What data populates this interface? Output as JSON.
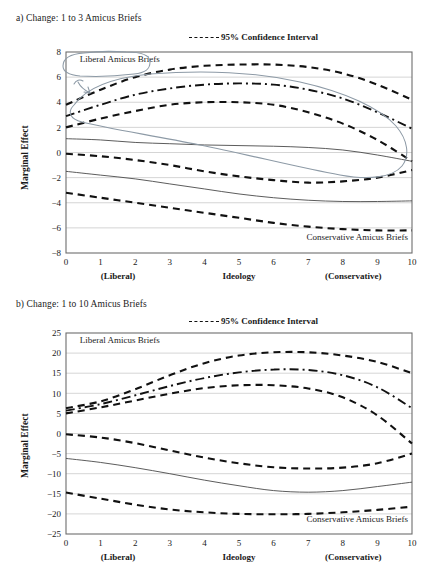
{
  "figure": {
    "panels": [
      {
        "id": "a",
        "title": "a) Change: 1 to 3 Amicus Briefs",
        "legend_label": "95% Confidence Interval",
        "ylabel": "Marginal Effect",
        "xlabel": "Ideology",
        "xcap_left": "(Liberal)",
        "xcap_right": "(Conservative)",
        "annotation_upper": "Liberal Amicus Briefs",
        "annotation_lower": "Conservative Amicus Briefs",
        "has_pen_annotation": true
      },
      {
        "id": "b",
        "title": "b) Change: 1 to 10 Amicus Briefs",
        "legend_label": "95% Confidence Interval",
        "ylabel": "Marginal Effect",
        "xlabel": "Ideology",
        "xcap_left": "(Liberal)",
        "xcap_right": "(Conservative)",
        "annotation_upper": "Liberal Amicus Briefs",
        "annotation_lower": "Conservative Amicus Briefs",
        "has_pen_annotation": false
      }
    ]
  },
  "chart_data": [
    {
      "type": "line",
      "panel": "a",
      "title": "a) Change: 1 to 3 Amicus Briefs",
      "xlabel": "Ideology",
      "ylabel": "Marginal Effect",
      "xlim": [
        0,
        10
      ],
      "ylim": [
        -8,
        8
      ],
      "xticks": [
        0,
        1,
        2,
        3,
        4,
        5,
        6,
        7,
        8,
        9,
        10
      ],
      "yticks": [
        -8,
        -6,
        -4,
        -2,
        0,
        2,
        4,
        6,
        8
      ],
      "grid": true,
      "legend": [
        "95% Confidence Interval"
      ],
      "legend_position": "above-plot-right",
      "annotations": [
        {
          "text": "Liberal Amicus Briefs",
          "x": 0.4,
          "y": 7.2
        },
        {
          "text": "Conservative Amicus Briefs",
          "x": 7.0,
          "y": -7.0
        }
      ],
      "x": [
        0,
        1,
        2,
        3,
        4,
        5,
        6,
        7,
        8,
        9,
        10
      ],
      "series": [
        {
          "name": "Liberal Amicus Briefs — upper 95% CI",
          "style": "dashed",
          "values": [
            3.8,
            5.0,
            6.0,
            6.6,
            6.9,
            7.0,
            7.0,
            6.8,
            6.3,
            5.4,
            4.2
          ]
        },
        {
          "name": "Liberal Amicus Briefs — mean",
          "style": "dash-dot",
          "values": [
            2.9,
            3.8,
            4.6,
            5.1,
            5.4,
            5.5,
            5.4,
            5.0,
            4.3,
            3.2,
            1.9
          ]
        },
        {
          "name": "Liberal Amicus Briefs — lower 95% CI",
          "style": "dashed",
          "values": [
            2.0,
            2.7,
            3.3,
            3.8,
            4.0,
            4.0,
            3.8,
            3.2,
            2.3,
            1.0,
            -0.7
          ]
        },
        {
          "name": "Conservative Amicus Briefs — upper 95% CI",
          "style": "dashed",
          "values": [
            -0.1,
            -0.3,
            -0.6,
            -1.0,
            -1.5,
            -1.9,
            -2.2,
            -2.4,
            -2.3,
            -2.0,
            -1.4
          ]
        },
        {
          "name": "Conservative Amicus Briefs — mean",
          "style": "solid",
          "values": [
            -1.5,
            -1.8,
            -2.1,
            -2.5,
            -2.9,
            -3.3,
            -3.6,
            -3.8,
            -3.9,
            -3.9,
            -3.85
          ]
        },
        {
          "name": "Conservative Amicus Briefs — lower 95% CI",
          "style": "dashed",
          "values": [
            -3.2,
            -3.6,
            -4.0,
            -4.4,
            -4.8,
            -5.2,
            -5.6,
            -5.9,
            -6.1,
            -6.2,
            -6.2
          ]
        },
        {
          "name": "Zero-crossing guide (thin)",
          "style": "solid-thin",
          "values": [
            1.1,
            1.0,
            0.8,
            0.7,
            0.6,
            0.55,
            0.5,
            0.4,
            0.2,
            -0.2,
            -0.7
          ]
        }
      ]
    },
    {
      "type": "line",
      "panel": "b",
      "title": "b) Change: 1 to 10 Amicus Briefs",
      "xlabel": "Ideology",
      "ylabel": "Marginal Effect",
      "xlim": [
        0,
        10
      ],
      "ylim": [
        -25,
        25
      ],
      "xticks": [
        0,
        1,
        2,
        3,
        4,
        5,
        6,
        7,
        8,
        9,
        10
      ],
      "yticks": [
        -25,
        -20,
        -15,
        -10,
        -5,
        0,
        5,
        10,
        15,
        20,
        25
      ],
      "grid": true,
      "legend": [
        "95% Confidence Interval"
      ],
      "legend_position": "above-plot-right",
      "annotations": [
        {
          "text": "Liberal Amicus Briefs",
          "x": 0.4,
          "y": 22.5
        },
        {
          "text": "Conservative Amicus Briefs",
          "x": 6.8,
          "y": -22.0
        }
      ],
      "x": [
        0,
        1,
        2,
        3,
        4,
        5,
        6,
        7,
        8,
        9,
        10
      ],
      "series": [
        {
          "name": "Liberal Amicus Briefs — upper 95% CI",
          "style": "dashed",
          "values": [
            6.3,
            8.0,
            11.0,
            14.5,
            17.5,
            19.4,
            20.2,
            20.2,
            19.4,
            17.8,
            15.0
          ]
        },
        {
          "name": "Liberal Amicus Briefs — mean",
          "style": "dash-dot",
          "values": [
            5.7,
            7.3,
            9.5,
            11.8,
            13.8,
            15.2,
            15.9,
            15.8,
            14.5,
            11.5,
            6.3
          ]
        },
        {
          "name": "Liberal Amicus Briefs — lower 95% CI",
          "style": "dashed",
          "values": [
            5.0,
            6.5,
            8.2,
            9.9,
            11.3,
            12.0,
            12.0,
            11.2,
            9.0,
            4.5,
            -2.5
          ]
        },
        {
          "name": "Conservative Amicus Briefs — upper 95% CI",
          "style": "dashed",
          "values": [
            -0.2,
            -1.0,
            -2.4,
            -4.2,
            -6.0,
            -7.4,
            -8.4,
            -8.7,
            -8.5,
            -7.4,
            -5.0
          ]
        },
        {
          "name": "Conservative Amicus Briefs — mean",
          "style": "solid",
          "values": [
            -6.2,
            -7.2,
            -8.5,
            -10.0,
            -11.6,
            -13.0,
            -14.2,
            -14.6,
            -14.2,
            -13.2,
            -12.1
          ]
        },
        {
          "name": "Conservative Amicus Briefs — lower 95% CI",
          "style": "dashed",
          "values": [
            -14.7,
            -16.2,
            -17.7,
            -18.9,
            -19.6,
            -20.0,
            -20.1,
            -20.0,
            -19.6,
            -19.0,
            -18.2
          ]
        }
      ]
    }
  ]
}
